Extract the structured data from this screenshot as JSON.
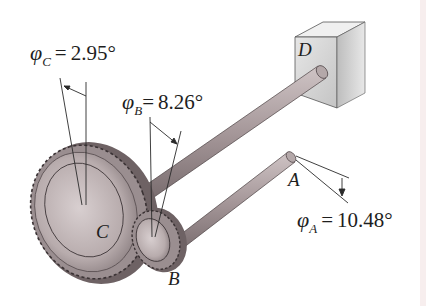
{
  "figure": {
    "labels": {
      "phi_c": {
        "symbol": "φ",
        "subscript": "C",
        "equals": "=",
        "value": "2.95°"
      },
      "phi_b": {
        "symbol": "φ",
        "subscript": "B",
        "equals": "=",
        "value": "8.26°"
      },
      "phi_a": {
        "symbol": "φ",
        "subscript": "A",
        "equals": "=",
        "value": "10.48°"
      },
      "point_a": "A",
      "point_b": "B",
      "point_c": "C",
      "point_d": "D"
    },
    "colors": {
      "shaft": "#9c8f90",
      "gear": "#bfb3b4",
      "gear_dark": "#6e6264",
      "support": "#d6d6d6",
      "line": "#2a2a2a"
    }
  }
}
